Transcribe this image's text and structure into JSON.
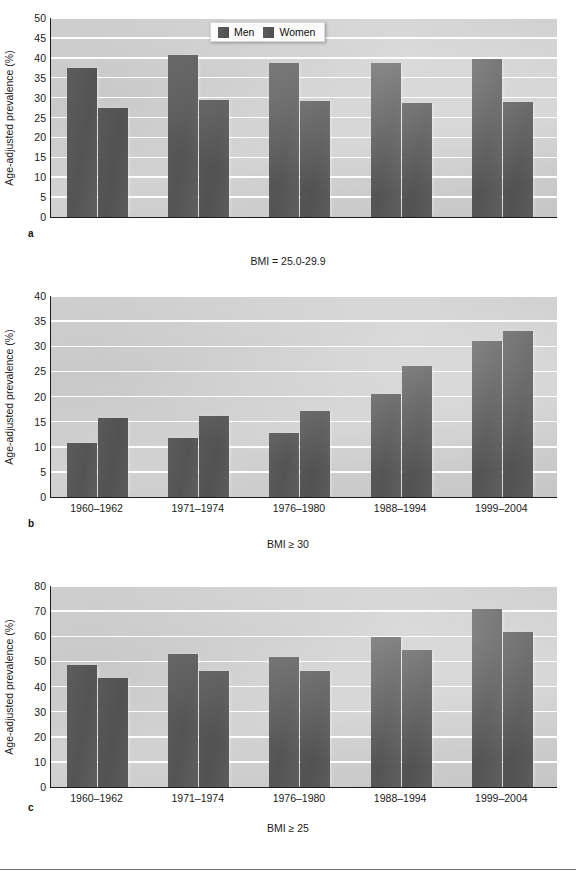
{
  "figure": {
    "legend": {
      "position": "top-center-panel-a",
      "entries": [
        "Men",
        "Women"
      ]
    },
    "axis_title": "Age-adjusted prevalence (%)",
    "bar_color": "#585858",
    "plot_background": "#cccccc",
    "gridline_color": "#ffffff"
  },
  "panels": [
    {
      "letter": "a",
      "caption": "BMI = 25.0-29.9"
    },
    {
      "letter": "b",
      "caption": "BMI ≥ 30"
    },
    {
      "letter": "c",
      "caption": "BMI ≥ 25"
    }
  ],
  "chart_data": [
    {
      "type": "bar",
      "title": "BMI = 25.0-29.9",
      "panel": "a",
      "xlabel": "",
      "ylabel": "Age-adjusted prevalence (%)",
      "ylim": [
        0,
        50
      ],
      "yticks": [
        0,
        5,
        10,
        15,
        20,
        25,
        30,
        35,
        40,
        45,
        50
      ],
      "grid": true,
      "legend": [
        "Men",
        "Women"
      ],
      "legend_position": "top center",
      "categories": [
        "1960–1962",
        "1971–1974",
        "1976–1980",
        "1988–1994",
        "1999–2004"
      ],
      "categories_visible": false,
      "series": [
        {
          "name": "Men",
          "values": [
            37.5,
            40.8,
            38.7,
            38.8,
            39.7
          ]
        },
        {
          "name": "Women",
          "values": [
            27.5,
            29.4,
            29.2,
            28.6,
            29.0
          ]
        }
      ]
    },
    {
      "type": "bar",
      "title": "BMI ≥ 30",
      "panel": "b",
      "xlabel": "",
      "ylabel": "Age-adjusted prevalence (%)",
      "ylim": [
        0,
        40
      ],
      "yticks": [
        0,
        5,
        10,
        15,
        20,
        25,
        30,
        35,
        40
      ],
      "grid": true,
      "legend": [
        "Men",
        "Women"
      ],
      "legend_position": "none",
      "categories": [
        "1960–1962",
        "1971–1974",
        "1976–1980",
        "1988–1994",
        "1999–2004"
      ],
      "categories_visible": true,
      "series": [
        {
          "name": "Men",
          "values": [
            10.7,
            11.8,
            12.8,
            20.6,
            31.1
          ]
        },
        {
          "name": "Women",
          "values": [
            15.8,
            16.1,
            17.1,
            26.0,
            33.0
          ]
        }
      ]
    },
    {
      "type": "bar",
      "title": "BMI ≥ 25",
      "panel": "c",
      "xlabel": "",
      "ylabel": "Age-adjusted prevalence (%)",
      "ylim": [
        0,
        80
      ],
      "yticks": [
        0,
        10,
        20,
        30,
        40,
        50,
        60,
        70,
        80
      ],
      "grid": true,
      "legend": [
        "Men",
        "Women"
      ],
      "legend_position": "none",
      "categories": [
        "1960–1962",
        "1971–1974",
        "1976–1980",
        "1988–1994",
        "1999–2004"
      ],
      "categories_visible": true,
      "series": [
        {
          "name": "Men",
          "values": [
            48.5,
            53.0,
            51.7,
            59.7,
            71.0
          ]
        },
        {
          "name": "Women",
          "values": [
            43.4,
            46.0,
            46.2,
            54.5,
            61.5
          ]
        }
      ]
    }
  ]
}
